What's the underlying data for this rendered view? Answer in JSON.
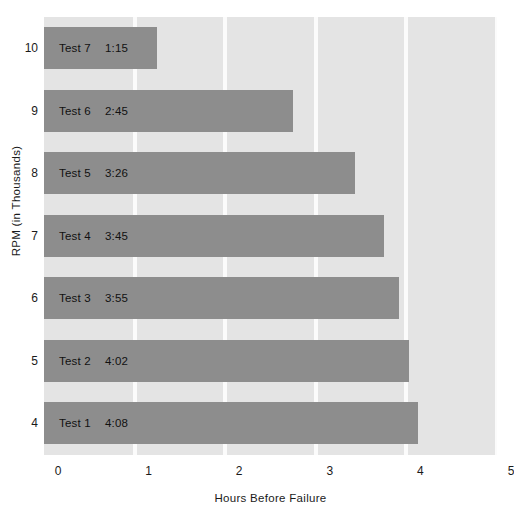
{
  "chart_data": {
    "type": "bar",
    "orientation": "horizontal",
    "title": "",
    "xlabel": "Hours Before Failure",
    "ylabel": "RPM (in Thousands)",
    "xlim": [
      0,
      5
    ],
    "xticks": [
      "0",
      "1",
      "2",
      "3",
      "4",
      "5"
    ],
    "yticks": [
      "10",
      "9",
      "8",
      "7",
      "6",
      "5",
      "4"
    ],
    "grid": true,
    "legend": "none",
    "categories": [
      "10",
      "9",
      "8",
      "7",
      "6",
      "5",
      "4"
    ],
    "values": [
      1.25,
      2.75,
      3.4333,
      3.75,
      3.9167,
      4.0333,
      4.1333
    ],
    "bars": [
      {
        "category": "10",
        "test": "Test 7",
        "time": "1:15",
        "value": 1.25
      },
      {
        "category": "9",
        "test": "Test 6",
        "time": "2:45",
        "value": 2.75
      },
      {
        "category": "8",
        "test": "Test 5",
        "time": "3:26",
        "value": 3.4333
      },
      {
        "category": "7",
        "test": "Test 4",
        "time": "3:45",
        "value": 3.75
      },
      {
        "category": "6",
        "test": "Test 3",
        "time": "3:55",
        "value": 3.9167
      },
      {
        "category": "5",
        "test": "Test 2",
        "time": "4:02",
        "value": 4.0333
      },
      {
        "category": "4",
        "test": "Test 1",
        "time": "4:08",
        "value": 4.1333
      }
    ],
    "colors": {
      "bar": "#8d8d8d",
      "plot_background": "#e4e4e4",
      "gridline": "#fbfbfb",
      "text": "#1a1a1a",
      "page_background": "#ffffff"
    }
  }
}
